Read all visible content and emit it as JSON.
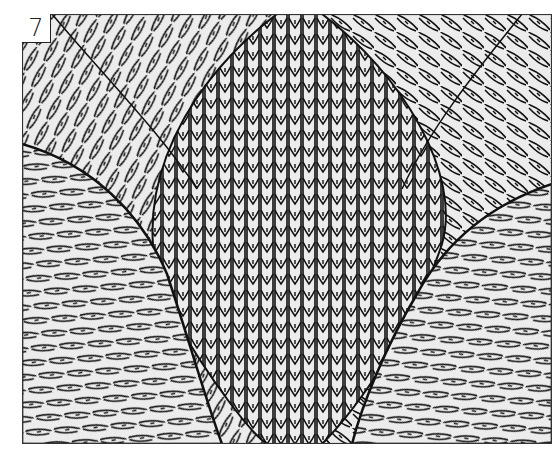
{
  "figure": {
    "label": "7",
    "colors": {
      "yarn_fill": "#ececec",
      "stitch_outline": "#111111",
      "frame": "#333333",
      "page": "#ffffff"
    },
    "regions": [
      {
        "name": "center-vertical-panel",
        "stitch_direction": "vertical"
      },
      {
        "name": "upper-left-curve-panel",
        "stitch_direction": "diagonal-right"
      },
      {
        "name": "upper-right-curve-panel",
        "stitch_direction": "diagonal-left"
      },
      {
        "name": "lower-left-curve-panel",
        "stitch_direction": "diagonal-arc"
      },
      {
        "name": "lower-right-curve-panel",
        "stitch_direction": "diagonal-arc"
      }
    ]
  }
}
